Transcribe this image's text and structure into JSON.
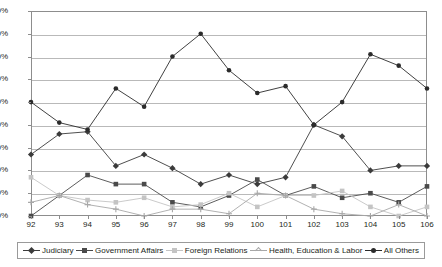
{
  "chart_data": {
    "type": "line",
    "title": "",
    "xlabel": "",
    "ylabel": "",
    "x": [
      "92",
      "93",
      "94",
      "95",
      "96",
      "97",
      "98",
      "99",
      "100",
      "101",
      "102",
      "103",
      "104",
      "105",
      "106"
    ],
    "categories": [
      "92",
      "93",
      "94",
      "95",
      "96",
      "97",
      "98",
      "99",
      "100",
      "101",
      "102",
      "103",
      "104",
      "105",
      "106"
    ],
    "ylim": [
      0,
      90
    ],
    "ytick_labels": [
      "0%",
      "10%",
      "20%",
      "30%",
      "40%",
      "50%",
      "60%",
      "70%",
      "80%",
      "90%"
    ],
    "ytick_values": [
      0,
      10,
      20,
      30,
      40,
      50,
      60,
      70,
      80,
      90
    ],
    "grid": true,
    "legend_position": "bottom",
    "series": [
      {
        "name": "Judiciary",
        "color": "#3b3b3b",
        "marker": "diamond",
        "values": [
          27,
          36,
          37,
          22,
          27,
          21,
          14,
          18,
          14,
          17,
          40,
          35,
          20,
          22,
          22
        ]
      },
      {
        "name": "Government Affairs",
        "color": "#4a4a4a",
        "marker": "square",
        "values": [
          0,
          9,
          18,
          14,
          14,
          6,
          4,
          9,
          16,
          9,
          13,
          8,
          10,
          6,
          13
        ]
      },
      {
        "name": "Foreign Relations",
        "color": "#c4c4c4",
        "marker": "square",
        "values": [
          17,
          9,
          7,
          6,
          8,
          4,
          5,
          10,
          4,
          9,
          9,
          11,
          4,
          0,
          4
        ]
      },
      {
        "name": "Health, Education & Labor",
        "color": "#a8a8a8",
        "marker": "cross",
        "values": [
          6,
          9,
          5,
          3,
          0,
          3,
          3,
          1,
          10,
          9,
          3,
          1,
          0,
          5,
          0
        ]
      },
      {
        "name": "All Others",
        "color": "#2b2b2b",
        "marker": "round",
        "values": [
          50,
          41,
          38,
          56,
          48,
          70,
          80,
          64,
          54,
          57,
          40,
          50,
          71,
          66,
          56
        ]
      }
    ]
  },
  "legend": {
    "items": [
      {
        "label": "Judiciary"
      },
      {
        "label": "Government Affairs"
      },
      {
        "label": "Foreign Relations"
      },
      {
        "label": "Health, Education & Labor"
      },
      {
        "label": "All Others"
      }
    ]
  }
}
